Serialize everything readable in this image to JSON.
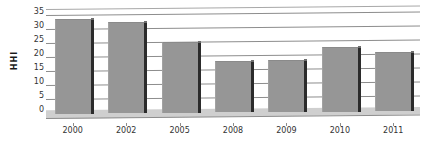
{
  "chart_data": {
    "type": "bar",
    "title": "",
    "subtitle": "",
    "xlabel": "",
    "ylabel": "HHI",
    "categories": [
      "2000",
      "2002",
      "2005",
      "2008",
      "2009",
      "2010",
      "2011"
    ],
    "values": [
      33.5,
      32,
      25,
      18,
      18,
      22.5,
      20.5
    ],
    "ylim": [
      0,
      37
    ],
    "y_ticks": [
      0,
      5,
      10,
      15,
      20,
      25,
      30,
      35
    ],
    "y_tick_labels": [
      "0",
      "5",
      "10",
      "15",
      "20",
      "25",
      "30",
      "35"
    ],
    "grid": true,
    "legend": false,
    "legend_position": "none",
    "series": [
      {
        "name": "HHI",
        "values": [
          33.5,
          32,
          25,
          18,
          18,
          22.5,
          20.5
        ]
      }
    ],
    "annotations": [],
    "style": {
      "bar_fill": "#969696",
      "bar_side_face": "#2b2b2b",
      "gridline_color": "#8d8d8d",
      "floor_color": "#cfcfcf",
      "text_color": "#333333",
      "background": "#ffffff",
      "three_d": true
    }
  }
}
